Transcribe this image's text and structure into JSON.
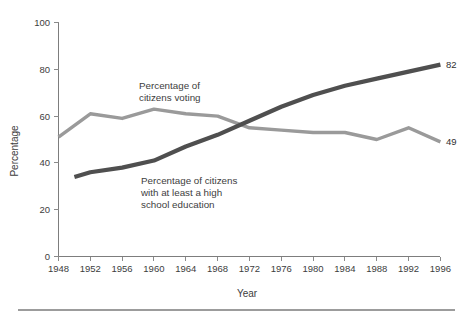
{
  "chart_data": {
    "type": "line",
    "title": "",
    "xlabel": "Year",
    "ylabel": "Percentage",
    "xlim": [
      1948,
      1996
    ],
    "ylim": [
      0,
      100
    ],
    "grid": false,
    "legend_position": "inline-annotation",
    "x_ticks": [
      "1948",
      "1952",
      "1956",
      "1960",
      "1964",
      "1968",
      "1972",
      "1976",
      "1980",
      "1984",
      "1988",
      "1992",
      "1996"
    ],
    "y_ticks": [
      "0",
      "20",
      "40",
      "60",
      "80",
      "100"
    ],
    "categories": [
      1948,
      1950,
      1952,
      1956,
      1960,
      1964,
      1968,
      1972,
      1976,
      1980,
      1984,
      1988,
      1992,
      1996
    ],
    "series": [
      {
        "name": "Percentage of citizens voting",
        "color": "#9a9a9a",
        "x": [
          1948,
          1952,
          1956,
          1960,
          1964,
          1968,
          1972,
          1976,
          1980,
          1984,
          1988,
          1992,
          1996
        ],
        "values": [
          51,
          61,
          59,
          63,
          61,
          60,
          55,
          54,
          53,
          53,
          50,
          55,
          49
        ],
        "end_label": "49"
      },
      {
        "name": "Percentage of citizens with at least a high school education",
        "color": "#4f4f4f",
        "x": [
          1950,
          1952,
          1956,
          1960,
          1964,
          1968,
          1972,
          1976,
          1980,
          1984,
          1988,
          1992,
          1996
        ],
        "values": [
          34,
          36,
          38,
          41,
          47,
          52,
          58,
          64,
          69,
          73,
          76,
          79,
          82
        ],
        "end_label": "82"
      }
    ],
    "annotations": [
      {
        "id": "voting-annotation",
        "lines": [
          "Percentage of",
          "citizens voting"
        ],
        "x": 1965,
        "y": 79
      },
      {
        "id": "education-annotation",
        "lines": [
          "Percentage of citizens",
          "with at least a high",
          "school education"
        ],
        "x": 1958,
        "y": 33
      }
    ],
    "end_labels": [
      {
        "id": "education-end-label",
        "text": "82",
        "value": 82
      },
      {
        "id": "voting-end-label",
        "text": "49",
        "value": 49
      }
    ]
  }
}
